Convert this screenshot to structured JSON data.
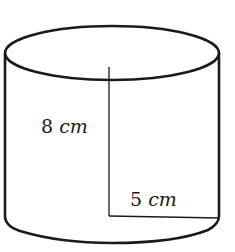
{
  "diagram": {
    "type": "cylinder",
    "height_label": {
      "value": "8",
      "unit": "cm"
    },
    "radius_label": {
      "value": "5",
      "unit": "cm"
    },
    "stroke_color": "#1a1a1a",
    "background": "#ffffff"
  }
}
